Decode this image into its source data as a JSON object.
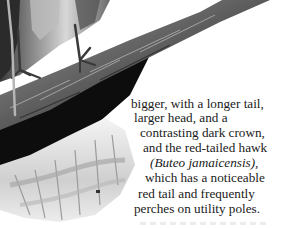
{
  "text": {
    "lines": [
      "bigger, with a longer tail,",
      "larger head, and a",
      "contrasting dark crown,",
      "and the red-tailed hawk",
      "(Buteo jamaicensis),",
      "which has a noticeable",
      "red tail and frequently",
      "perches on utility poles."
    ]
  }
}
